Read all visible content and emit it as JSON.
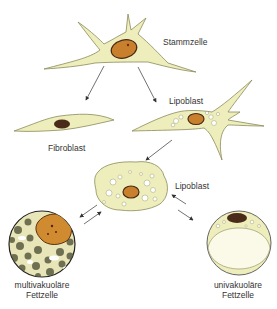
{
  "diagram": {
    "type": "cell differentiation lineage",
    "colors": {
      "cytoplasm": "#eeeebc",
      "cytoplasm_outline": "#8a8a5a",
      "nucleus": "#c8802c",
      "nucleus_dark": "#4a2a18",
      "vacuole": "#ffffff",
      "fat_droplet": "#f4f2d8",
      "arrow": "#333333"
    },
    "nodes": [
      {
        "id": "stammzelle",
        "label": "Stammzelle"
      },
      {
        "id": "fibroblast",
        "label": "Fibroblast"
      },
      {
        "id": "lipoblast_1",
        "label": "Lipoblast"
      },
      {
        "id": "lipoblast_2",
        "label": "Lipoblast"
      },
      {
        "id": "multivakuolaer",
        "label_line1": "multivakuoläre",
        "label_line2": "Fettzelle"
      },
      {
        "id": "univakuolaer",
        "label_line1": "univakuoläre",
        "label_line2": "Fettzelle"
      }
    ],
    "edges": [
      {
        "from": "stammzelle",
        "to": "fibroblast",
        "direction": "one-way"
      },
      {
        "from": "stammzelle",
        "to": "lipoblast_1",
        "direction": "one-way"
      },
      {
        "from": "lipoblast_1",
        "to": "lipoblast_2",
        "direction": "one-way"
      },
      {
        "from": "lipoblast_2",
        "to": "multivakuolaer",
        "direction": "bidirectional"
      },
      {
        "from": "lipoblast_2",
        "to": "univakuolaer",
        "direction": "bidirectional"
      }
    ]
  }
}
